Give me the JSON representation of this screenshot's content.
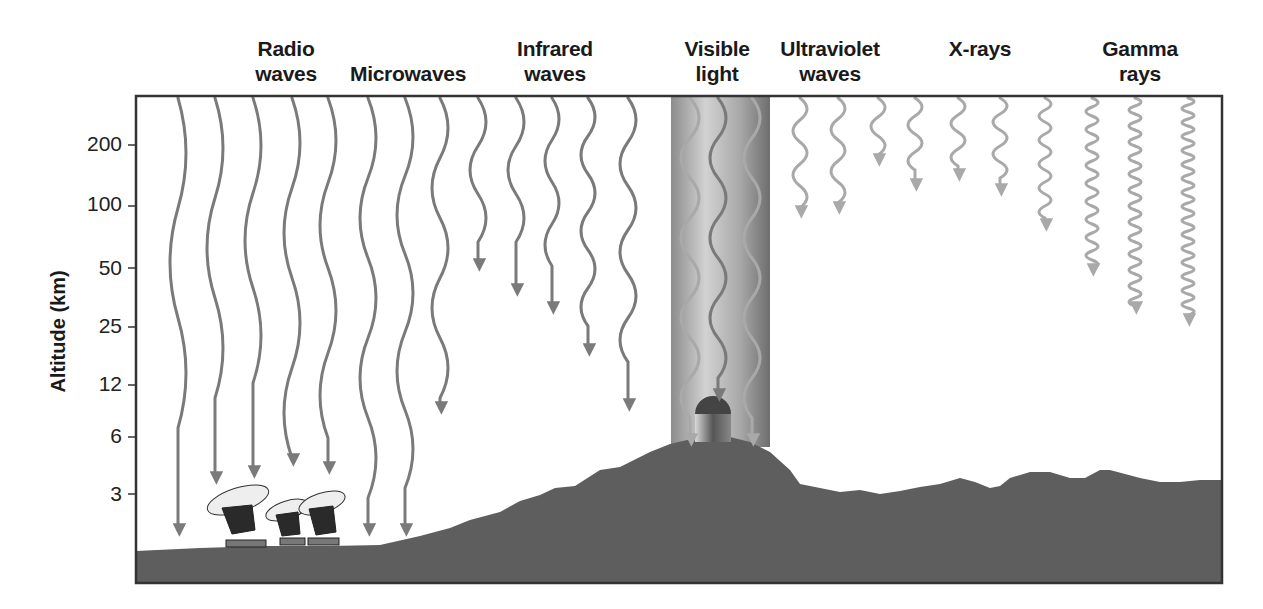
{
  "diagram": {
    "categories": [
      {
        "id": "radio",
        "line1": "Radio",
        "line2": "waves"
      },
      {
        "id": "micro",
        "line1": "Microwaves",
        "line2": ""
      },
      {
        "id": "infrared",
        "line1": "Infrared",
        "line2": "waves"
      },
      {
        "id": "visible",
        "line1": "Visible",
        "line2": "light"
      },
      {
        "id": "uv",
        "line1": "Ultraviolet",
        "line2": "waves"
      },
      {
        "id": "xray",
        "line1": "X-rays",
        "line2": ""
      },
      {
        "id": "gamma",
        "line1": "Gamma",
        "line2": "rays"
      }
    ],
    "y_axis": {
      "label": "Altitude (km)",
      "ticks": [
        "200",
        "100",
        "50",
        "25",
        "12",
        "6",
        "3"
      ]
    },
    "objects": {
      "radio_telescopes": "Radio telescope dishes at ground level",
      "observatory": "Optical observatory dome on mountain peak"
    },
    "colors": {
      "wave": "#7a7a7a",
      "wave_light": "#a9a9a9",
      "ground": "#5e5e5e",
      "frame": "#333333",
      "visible_band": "#9a9a9a"
    }
  }
}
